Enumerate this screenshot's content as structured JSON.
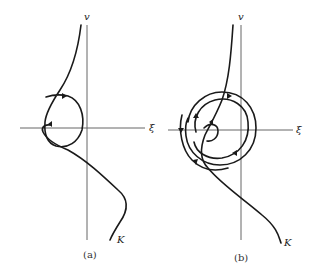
{
  "figure": {
    "panels": [
      {
        "id": "a",
        "caption": "(a)",
        "axis_labels": {
          "vertical": "v",
          "horizontal": "ξ"
        },
        "curve_label": "K",
        "description": "Trajectory K descending from top, forming a single loop around the origin region with direction arrows"
      },
      {
        "id": "b",
        "caption": "(b)",
        "axis_labels": {
          "vertical": "v",
          "horizontal": "ξ"
        },
        "curve_label": "K",
        "description": "Trajectory K descending from top, spiraling outward in multiple concentric loops with direction arrows"
      }
    ]
  },
  "colors": {
    "ink": "#1a1a1a",
    "axis": "#555555",
    "background": "#ffffff"
  }
}
